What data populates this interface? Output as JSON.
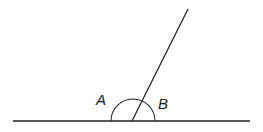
{
  "diagram": {
    "type": "angles-on-straight-line",
    "labels": {
      "angle_a": "A",
      "angle_b": "B"
    },
    "stroke_color": "#222222",
    "background": "#ffffff"
  }
}
